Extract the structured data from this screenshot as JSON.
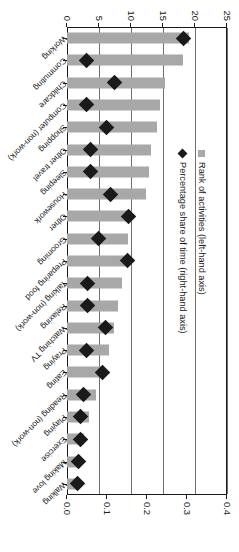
{
  "chart_data": {
    "type": "bar",
    "title": "",
    "xlabel": "",
    "ylabel": "Rank of activities",
    "y2label": "Percentage share of time",
    "ylim": [
      0,
      25
    ],
    "y2lim": [
      0.0,
      0.4
    ],
    "grid": true,
    "legend_position": "inside-left",
    "orientation": "rotated-90",
    "categories": [
      "Working",
      "Commuting",
      "Childcare",
      "Computer (non-work)",
      "Shopping",
      "Other travel",
      "Sleeping",
      "Housework",
      "Other",
      "Grooming",
      "Preparing food",
      "Talking (non-work)",
      "Relaxing",
      "Watching TV",
      "Praying",
      "Eating",
      "Reading (non-work)",
      "Playing",
      "Exercise",
      "Making love",
      "Walking"
    ],
    "series": [
      {
        "name": "Rank of activities (left-hand axis)",
        "axis": "left",
        "type": "bar",
        "color": "#a8a8a8",
        "values": [
          19.0,
          18.2,
          15.3,
          14.6,
          14.0,
          13.2,
          12.8,
          12.4,
          10.2,
          9.6,
          9.2,
          8.6,
          8.0,
          7.3,
          6.6,
          5.8,
          4.6,
          3.4,
          2.6,
          2.0,
          1.6
        ]
      },
      {
        "name": "Percentage share of time (right-hand axis)",
        "axis": "right",
        "type": "scatter",
        "color": "#1a1a1a",
        "values": [
          0.292,
          0.05,
          0.118,
          0.049,
          0.098,
          0.06,
          0.058,
          0.108,
          0.155,
          0.079,
          0.152,
          0.051,
          0.052,
          0.097,
          0.048,
          0.09,
          0.042,
          0.035,
          0.035,
          0.03,
          0.026
        ]
      }
    ],
    "left_axis_ticks": [
      "0",
      "5",
      "10",
      "15",
      "20",
      "25"
    ],
    "right_axis_ticks": [
      "0.0",
      "0.1",
      "0.2",
      "0.3",
      "0.4"
    ]
  },
  "legend": {
    "entries": [
      {
        "label": "Rank of activities (left-hand axis)",
        "marker": "bar-swatch"
      },
      {
        "label": "Percentage share of time (right-hand axis)",
        "marker": "diamond-swatch"
      }
    ]
  }
}
